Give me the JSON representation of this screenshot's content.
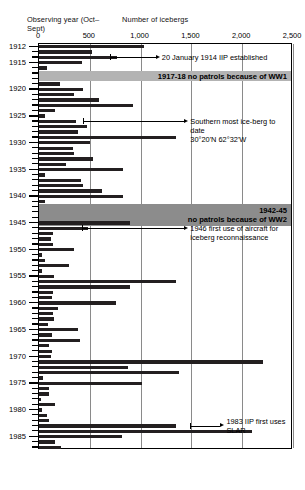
{
  "axes": {
    "y_title": "Observing\nyear (Oct–Sept)",
    "x_title": "Number of icebergs",
    "x_ticks": [
      "0",
      "500",
      "1,000",
      "1,500",
      "2,000",
      "2,500"
    ],
    "y_ticks": [
      "1912",
      "1915",
      "1920",
      "1925",
      "1930",
      "1935",
      "1940",
      "1945",
      "1950",
      "1955",
      "1960",
      "1965",
      "1970",
      "1975",
      "1980",
      "1985"
    ]
  },
  "bands": [
    {
      "label": "1917-18 no patrols because of WW1",
      "start_year": 1917,
      "end_year": 1918,
      "color": "#b3b3b3"
    },
    {
      "label": "1942-45\nno patrols because of WW2",
      "start_year": 1942,
      "end_year": 1945,
      "color": "#8c8c8c"
    }
  ],
  "annotations": [
    {
      "text": "20 January 1914 IIP established",
      "year": 1914,
      "value": 700
    },
    {
      "text": "Southern most ice-berg to date\n30°20'N 62°32'W",
      "year": 1926,
      "value": 430
    },
    {
      "text": "1946 first use of aircraft for\niceberg reconnaissance",
      "year": 1946,
      "value": 420
    },
    {
      "text": "1983 IIP first uses SLAR",
      "year": 1983,
      "value": 1490
    }
  ],
  "chart_data": {
    "type": "bar",
    "orientation": "horizontal",
    "xlabel": "Number of icebergs",
    "ylabel": "Observing year (Oct–Sept)",
    "xlim": [
      0,
      2500
    ],
    "grid": true,
    "legend": "none",
    "categories": [
      1912,
      1913,
      1914,
      1915,
      1916,
      1917,
      1918,
      1919,
      1920,
      1921,
      1922,
      1923,
      1924,
      1925,
      1926,
      1927,
      1928,
      1929,
      1930,
      1931,
      1932,
      1933,
      1934,
      1935,
      1936,
      1937,
      1938,
      1939,
      1940,
      1941,
      1942,
      1943,
      1944,
      1945,
      1946,
      1947,
      1948,
      1949,
      1950,
      1951,
      1952,
      1953,
      1954,
      1955,
      1956,
      1957,
      1958,
      1959,
      1960,
      1961,
      1962,
      1963,
      1964,
      1965,
      1966,
      1967,
      1968,
      1969,
      1970,
      1971,
      1972,
      1973,
      1974,
      1975,
      1976,
      1977,
      1978,
      1979,
      1980,
      1981,
      1982,
      1983,
      1984,
      1985,
      1986,
      1987
    ],
    "values": [
      1038,
      520,
      765,
      420,
      80,
      0,
      0,
      210,
      430,
      340,
      590,
      930,
      160,
      60,
      360,
      470,
      380,
      1350,
      500,
      330,
      340,
      530,
      270,
      830,
      60,
      410,
      430,
      620,
      830,
      60,
      0,
      0,
      0,
      900,
      480,
      140,
      115,
      140,
      340,
      30,
      55,
      300,
      25,
      150,
      1350,
      900,
      135,
      125,
      760,
      190,
      140,
      150,
      90,
      380,
      130,
      400,
      95,
      130,
      115,
      2200,
      880,
      1380,
      40,
      1010,
      95,
      100,
      18,
      155,
      30,
      75,
      100,
      1350,
      2100,
      820,
      155,
      215
    ]
  }
}
